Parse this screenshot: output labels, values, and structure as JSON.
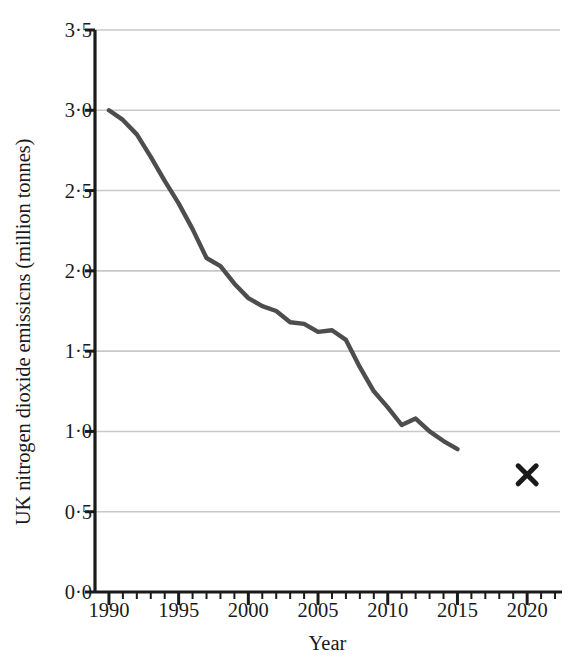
{
  "chart_data": {
    "type": "line",
    "title": "",
    "xlabel": "Year",
    "ylabel": "UK nitrogen dioxide emissicns (million tonnes)",
    "xlim": [
      1989.0,
      2022.5
    ],
    "ylim": [
      0.0,
      3.5
    ],
    "grid": "horizontal",
    "legend": "none",
    "y_ticks": [
      {
        "value": 0.0,
        "label": "0·0"
      },
      {
        "value": 0.5,
        "label": "0·5"
      },
      {
        "value": 1.0,
        "label": "1·0"
      },
      {
        "value": 1.5,
        "label": "1·5"
      },
      {
        "value": 2.0,
        "label": "2·0"
      },
      {
        "value": 2.5,
        "label": "2·5"
      },
      {
        "value": 3.0,
        "label": "3·0"
      },
      {
        "value": 3.5,
        "label": "3·5"
      }
    ],
    "x_ticks": [
      {
        "value": 1990,
        "label": "1990"
      },
      {
        "value": 1995,
        "label": "1995"
      },
      {
        "value": 2000,
        "label": "2000"
      },
      {
        "value": 2005,
        "label": "2005"
      },
      {
        "value": 2010,
        "label": "2010"
      },
      {
        "value": 2015,
        "label": "2015"
      },
      {
        "value": 2020,
        "label": "2020"
      }
    ],
    "x_minor_tick_interval": 1,
    "series": [
      {
        "name": "UK nitrogen dioxide emissions",
        "style": "line",
        "color": "#4d4d4d",
        "x": [
          1990,
          1991,
          1992,
          1993,
          1994,
          1995,
          1996,
          1997,
          1998,
          1999,
          2000,
          2001,
          2002,
          2003,
          2004,
          2005,
          2006,
          2007,
          2008,
          2009,
          2010,
          2011,
          2012,
          2013,
          2014,
          2015
        ],
        "values": [
          3.0,
          2.94,
          2.85,
          2.71,
          2.56,
          2.42,
          2.26,
          2.08,
          2.03,
          1.92,
          1.83,
          1.78,
          1.75,
          1.68,
          1.67,
          1.62,
          1.63,
          1.57,
          1.4,
          1.25,
          1.15,
          1.04,
          1.08,
          1.0,
          0.94,
          0.89
        ]
      },
      {
        "name": "2020 target",
        "style": "marker",
        "marker": "x",
        "color": "#1a1a1a",
        "x": [
          2020
        ],
        "values": [
          0.73
        ]
      }
    ],
    "annotations": []
  },
  "axes": {
    "y_axis_title": "UK nitrogen dioxide emissicns (million tonnes)",
    "x_axis_title": "Year"
  },
  "colors": {
    "line": "#4d4d4d",
    "marker": "#1a1a1a",
    "grid": "#c8c8c8",
    "axis": "#1a1a1a",
    "background": "#ffffff"
  }
}
